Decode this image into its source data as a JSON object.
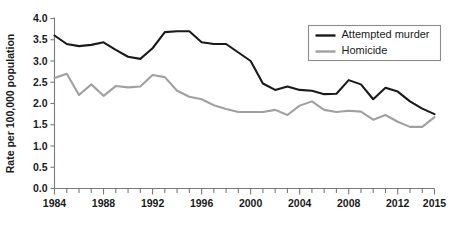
{
  "chart_data": {
    "type": "line",
    "title": "",
    "xlabel": "",
    "ylabel": "Rate per 100,000 population",
    "xlim": [
      1984,
      2015
    ],
    "ylim": [
      0.0,
      4.0
    ],
    "grid": false,
    "legend_position": "top-right",
    "x": [
      1984,
      1985,
      1986,
      1987,
      1988,
      1989,
      1990,
      1991,
      1992,
      1993,
      1994,
      1995,
      1996,
      1997,
      1998,
      1999,
      2000,
      2001,
      2002,
      2003,
      2004,
      2005,
      2006,
      2007,
      2008,
      2009,
      2010,
      2011,
      2012,
      2013,
      2014,
      2015
    ],
    "xtick_labels": [
      "1984",
      "1988",
      "1992",
      "1996",
      "2000",
      "2004",
      "2008",
      "2012",
      "2015"
    ],
    "xtick_values": [
      1984,
      1988,
      1992,
      1996,
      2000,
      2004,
      2008,
      2012,
      2015
    ],
    "ytick_labels": [
      "0.0",
      "0.5",
      "1.0",
      "1.5",
      "2.0",
      "2.5",
      "3.0",
      "3.5",
      "4.0"
    ],
    "ytick_values": [
      0.0,
      0.5,
      1.0,
      1.5,
      2.0,
      2.5,
      3.0,
      3.5,
      4.0
    ],
    "series": [
      {
        "name": "Attempted murder",
        "color": "#1a1a1a",
        "values": [
          3.6,
          3.4,
          3.35,
          3.38,
          3.44,
          3.26,
          3.1,
          3.05,
          3.3,
          3.68,
          3.7,
          3.7,
          3.44,
          3.4,
          3.4,
          3.2,
          3.0,
          2.47,
          2.32,
          2.4,
          2.32,
          2.3,
          2.22,
          2.23,
          2.55,
          2.45,
          2.1,
          2.37,
          2.28,
          2.05,
          1.88,
          1.75
        ]
      },
      {
        "name": "Homicide",
        "color": "#a0a0a0",
        "values": [
          2.6,
          2.7,
          2.2,
          2.45,
          2.18,
          2.41,
          2.38,
          2.4,
          2.67,
          2.62,
          2.3,
          2.16,
          2.1,
          1.96,
          1.87,
          1.8,
          1.8,
          1.8,
          1.85,
          1.73,
          1.95,
          2.05,
          1.85,
          1.8,
          1.83,
          1.81,
          1.62,
          1.73,
          1.57,
          1.45,
          1.45,
          1.68
        ]
      }
    ]
  },
  "legend": {
    "items": [
      {
        "label": "Attempted murder",
        "color": "#1a1a1a"
      },
      {
        "label": "Homicide",
        "color": "#a0a0a0"
      }
    ]
  }
}
